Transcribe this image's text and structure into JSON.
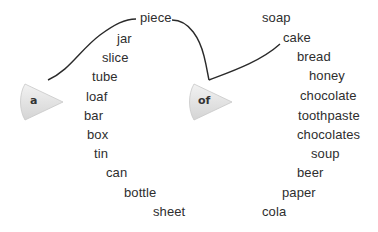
{
  "diagram": {
    "hubs": [
      {
        "label": "a",
        "x": 18,
        "y": 82,
        "connects_to": "piece"
      },
      {
        "label": "of",
        "x": 187,
        "y": 82,
        "connects_to": [
          "piece",
          "cake"
        ]
      }
    ],
    "left_column": {
      "title_word": "piece",
      "words": [
        "piece",
        "jar",
        "slice",
        "tube",
        "loaf",
        "bar",
        "box",
        "tin",
        "can",
        "bottle",
        "sheet"
      ]
    },
    "right_column": {
      "words": [
        "soap",
        "cake",
        "bread",
        "honey",
        "chocolate",
        "toothpaste",
        "chocolates",
        "soup",
        "beer",
        "paper",
        "cola"
      ]
    }
  }
}
